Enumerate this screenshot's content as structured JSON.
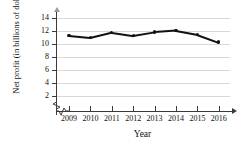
{
  "chart_data": {
    "type": "line",
    "title": "",
    "xlabel": "Year",
    "ylabel": "Net profit (in billions of dollars)",
    "categories": [
      "2009",
      "2010",
      "2011",
      "2012",
      "2013",
      "2014",
      "2015",
      "2016"
    ],
    "values": [
      11.3,
      11.0,
      11.8,
      11.3,
      11.85,
      12.1,
      11.5,
      10.3
    ],
    "series": [
      {
        "name": "Net profit",
        "values": [
          11.3,
          11.0,
          11.8,
          11.3,
          11.85,
          12.1,
          11.5,
          10.3
        ]
      }
    ],
    "ytick_labels": [
      "2",
      "4",
      "6",
      "8",
      "10",
      "12",
      "14"
    ],
    "ytick_values": [
      2,
      4,
      6,
      8,
      10,
      12,
      14
    ],
    "ylim": [
      0,
      15
    ],
    "xlim": [
      2008.4,
      2016.8
    ],
    "grid": true,
    "legend": "none",
    "axis_break": true,
    "marker_style": "filled-circle",
    "line_color": "#121212",
    "grid_color": "#d8d8d8",
    "axis_color": "#3a3a3a"
  },
  "labels": {
    "cut_title": "",
    "y_axis_title": "Net profit (in billions of dollars)",
    "x_axis_title": "Year"
  }
}
